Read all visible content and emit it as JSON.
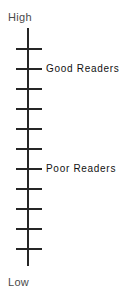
{
  "figure": {
    "width": 125,
    "height": 299,
    "background": "#ffffff",
    "axis_color": "#262626",
    "scale_label_color": "#4a4a4a",
    "group_label_color": "#111111"
  },
  "scale": {
    "top_label": "High",
    "bottom_label": "Low"
  },
  "groups": [
    {
      "label": "Good Readers",
      "tick_index": 1
    },
    {
      "label": "Poor Readers",
      "tick_index": 6
    }
  ],
  "chart_data": {
    "type": "line",
    "title": "",
    "subtitle": "",
    "xlabel": "",
    "ylabel": "",
    "orientation": "vertical",
    "axis": {
      "name": "reading ability",
      "low_label": "Low",
      "high_label": "High",
      "tick_count": 11,
      "tick_values": [
        10,
        9,
        8,
        7,
        6,
        5,
        4,
        3,
        2,
        1,
        0
      ],
      "gridlines": false,
      "numeric_tick_labels": false
    },
    "categories": [
      "Good Readers",
      "Poor Readers"
    ],
    "values": [
      9,
      4
    ],
    "annotations": [
      {
        "text": "High",
        "position": "axis-top",
        "tick_index": null
      },
      {
        "text": "Good Readers",
        "position": "right-of-axis",
        "tick_index": 1
      },
      {
        "text": "Poor Readers",
        "position": "right-of-axis",
        "tick_index": 6
      },
      {
        "text": "Low",
        "position": "axis-bottom",
        "tick_index": null
      }
    ],
    "legend": {
      "visible": false,
      "position": "none"
    }
  }
}
